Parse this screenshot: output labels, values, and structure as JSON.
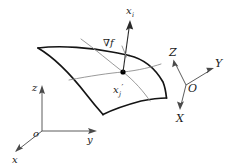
{
  "figure": {
    "background_color": "#ffffff",
    "surface_stroke_color": "#141414",
    "tangent_stroke_color": "#8e8e8e",
    "axis_stroke_color": "#4a4a4a"
  },
  "labels": {
    "gradient": "∇f",
    "normal_axis_base": "x",
    "normal_axis_sub": "i",
    "point_base": "x",
    "point_sub": "j",
    "point_prime": "′",
    "global_origin": "O",
    "global_x": "X",
    "global_y": "Y",
    "global_z": "Z",
    "local_origin": "o",
    "local_x": "x",
    "local_y": "y",
    "local_z": "z"
  },
  "geometry": {
    "point_marker": {
      "x": 123,
      "y": 72,
      "radius": 2.6
    },
    "gradient_vector": {
      "from_x": 123,
      "from_y": 72,
      "to_x": 130,
      "to_y": 22
    },
    "surface_corners": {
      "left": "38,48",
      "bottom": "103,114",
      "right": "166,98",
      "top": "128,55"
    },
    "local_frame_origin": {
      "x": 42,
      "y": 131
    },
    "global_frame_origin": {
      "x": 186,
      "y": 85
    }
  }
}
